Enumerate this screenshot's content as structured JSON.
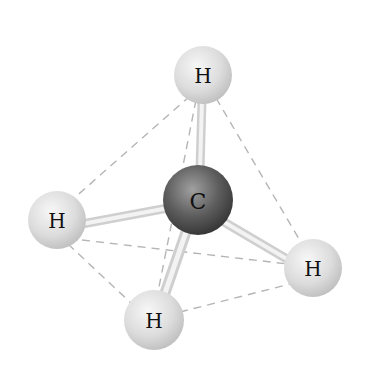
{
  "diagram": {
    "colors": {
      "background": "#ffffff",
      "hydrogen": "#e4e4e4",
      "carbon": "#555555",
      "bond": "#e0e0e0",
      "edge_dash": "#b5b5b5"
    },
    "atoms": {
      "h_top": {
        "label": "H"
      },
      "h_left": {
        "label": "H"
      },
      "h_right": {
        "label": "H"
      },
      "h_bottom": {
        "label": "H"
      },
      "c_center": {
        "label": "C"
      }
    }
  }
}
